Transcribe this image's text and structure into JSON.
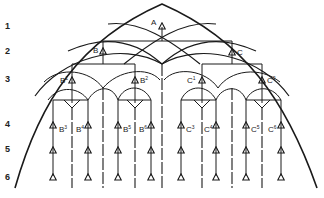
{
  "row_labels": [
    "1",
    "2",
    "3",
    "4",
    "5",
    "6"
  ],
  "nodes": {
    "A": {
      "label": "A",
      "sup": ""
    },
    "B": {
      "label": "B",
      "sup": ""
    },
    "C": {
      "label": "C",
      "sup": ""
    },
    "B1": {
      "label": "B",
      "sup": "1"
    },
    "B2": {
      "label": "B",
      "sup": "2"
    },
    "C1": {
      "label": "C",
      "sup": "1"
    },
    "C2": {
      "label": "C",
      "sup": "2"
    },
    "B3": {
      "label": "B",
      "sup": "3"
    },
    "B4": {
      "label": "B",
      "sup": "4"
    },
    "B5": {
      "label": "B",
      "sup": "5"
    },
    "B6": {
      "label": "B",
      "sup": "6"
    },
    "C3": {
      "label": "C",
      "sup": "3"
    },
    "C4": {
      "label": "C",
      "sup": "4"
    },
    "C5": {
      "label": "C",
      "sup": "5"
    },
    "C6": {
      "label": "C",
      "sup": "6"
    }
  },
  "colors": {
    "line": "#1a1a1a",
    "background": "#ffffff"
  }
}
